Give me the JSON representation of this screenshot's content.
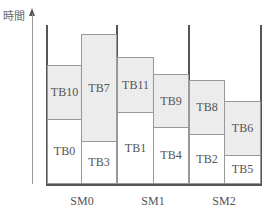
{
  "diagram": {
    "y_axis_label": "時間",
    "streaming_multiprocessors": [
      {
        "label": "SM0",
        "columns": [
          {
            "blocks": [
              {
                "label": "TB0",
                "shade": "first"
              },
              {
                "label": "TB10",
                "shade": "second"
              }
            ]
          },
          {
            "blocks": [
              {
                "label": "TB3",
                "shade": "first"
              },
              {
                "label": "TB7",
                "shade": "second"
              }
            ]
          }
        ]
      },
      {
        "label": "SM1",
        "columns": [
          {
            "blocks": [
              {
                "label": "TB1",
                "shade": "first"
              },
              {
                "label": "TB11",
                "shade": "second"
              }
            ]
          },
          {
            "blocks": [
              {
                "label": "TB4",
                "shade": "first"
              },
              {
                "label": "TB9",
                "shade": "second"
              }
            ]
          }
        ]
      },
      {
        "label": "SM2",
        "columns": [
          {
            "blocks": [
              {
                "label": "TB2",
                "shade": "first"
              },
              {
                "label": "TB8",
                "shade": "second"
              }
            ]
          },
          {
            "blocks": [
              {
                "label": "TB5",
                "shade": "first"
              },
              {
                "label": "TB6",
                "shade": "second"
              }
            ]
          }
        ]
      }
    ],
    "colors": {
      "first_block": "#ffffff",
      "second_block": "#efefef",
      "lines": "#555555"
    }
  }
}
